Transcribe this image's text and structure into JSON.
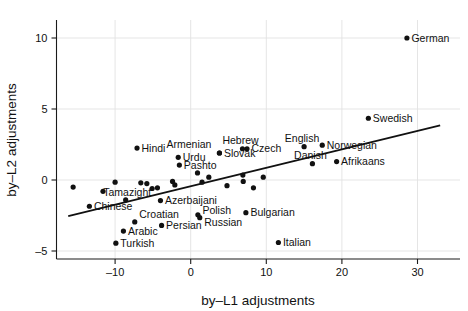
{
  "chart_data": {
    "type": "scatter",
    "title": "",
    "xlabel": "by–L1 adjustments",
    "ylabel": "by–L2 adjustments",
    "xlim": [
      -17.5,
      34.5
    ],
    "ylim": [
      -5.6,
      11.3
    ],
    "xticks": [
      -10,
      0,
      10,
      20,
      30
    ],
    "xticklabels": [
      "–10",
      "0",
      "10",
      "20",
      "30"
    ],
    "yticks": [
      -5,
      0,
      5,
      10
    ],
    "yticklabels": [
      "–5",
      "0",
      "5",
      "10"
    ],
    "grid": true,
    "legend": null,
    "marker": "filled-circle",
    "marker_color": "#111111",
    "fit_line": {
      "type": "linear-regression",
      "x_start": -16.2,
      "y_start": -2.55,
      "x_end": 33.0,
      "y_end": 3.85,
      "color": "#111111"
    },
    "points": [
      {
        "label": "German",
        "x": 28.6,
        "y": 10.0,
        "label_pos": "right"
      },
      {
        "label": "Swedish",
        "x": 23.5,
        "y": 4.35,
        "label_pos": "right"
      },
      {
        "label": "English",
        "x": 15.0,
        "y": 2.35,
        "label_pos": "above"
      },
      {
        "label": "Norwegian",
        "x": 17.4,
        "y": 2.45,
        "label_pos": "right"
      },
      {
        "label": "Danish",
        "x": 16.1,
        "y": 1.15,
        "label_pos": "above"
      },
      {
        "label": "Afrikaans",
        "x": 19.3,
        "y": 1.3,
        "label_pos": "right"
      },
      {
        "label": "Czech",
        "x": 7.45,
        "y": 2.2,
        "label_pos": "right"
      },
      {
        "label": "Hebrew",
        "x": 6.85,
        "y": 2.2,
        "label_pos": "above"
      },
      {
        "label": "Slovak",
        "x": 3.8,
        "y": 1.9,
        "label_pos": "right"
      },
      {
        "label": "Armenian",
        "x": 3.8,
        "y": 1.9,
        "label_pos": "far-left"
      },
      {
        "label": "Hindi",
        "x": -7.1,
        "y": 2.25,
        "label_pos": "right"
      },
      {
        "label": "Urdu",
        "x": -1.65,
        "y": 1.6,
        "label_pos": "right"
      },
      {
        "label": "Pashto",
        "x": -1.5,
        "y": 1.05,
        "label_pos": "right"
      },
      {
        "label": "Bulgarian",
        "x": 7.3,
        "y": -2.3,
        "label_pos": "right"
      },
      {
        "label": "Italian",
        "x": 11.6,
        "y": -4.4,
        "label_pos": "right"
      },
      {
        "label": "Polish",
        "x": 0.95,
        "y": -2.45,
        "label_pos": "right-upper"
      },
      {
        "label": "Russian",
        "x": 1.2,
        "y": -2.65,
        "label_pos": "right-lower"
      },
      {
        "label": "Persian",
        "x": -3.85,
        "y": -3.2,
        "label_pos": "right"
      },
      {
        "label": "Croatian",
        "x": -7.4,
        "y": -2.95,
        "label_pos": "above-right"
      },
      {
        "label": "Arabic",
        "x": -8.9,
        "y": -3.6,
        "label_pos": "right"
      },
      {
        "label": "Turkish",
        "x": -9.9,
        "y": -4.45,
        "label_pos": "right"
      },
      {
        "label": "Chinese",
        "x": -13.4,
        "y": -1.85,
        "label_pos": "right"
      },
      {
        "label": "Azerbaijani",
        "x": -4.0,
        "y": -1.45,
        "label_pos": "right"
      },
      {
        "label": "Tamazight",
        "x": -5.1,
        "y": -0.6,
        "label_pos": "below-left"
      },
      {
        "label": "",
        "x": -15.55,
        "y": -0.5,
        "label_pos": ""
      },
      {
        "label": "",
        "x": -11.6,
        "y": -0.8,
        "label_pos": ""
      },
      {
        "label": "",
        "x": -10.0,
        "y": -0.15,
        "label_pos": ""
      },
      {
        "label": "",
        "x": -8.6,
        "y": -1.4,
        "label_pos": ""
      },
      {
        "label": "",
        "x": -6.6,
        "y": -0.2,
        "label_pos": ""
      },
      {
        "label": "",
        "x": -5.8,
        "y": -0.25,
        "label_pos": ""
      },
      {
        "label": "",
        "x": -4.4,
        "y": -0.55,
        "label_pos": ""
      },
      {
        "label": "",
        "x": -2.4,
        "y": -0.1,
        "label_pos": ""
      },
      {
        "label": "",
        "x": -2.1,
        "y": -0.35,
        "label_pos": ""
      },
      {
        "label": "",
        "x": 0.9,
        "y": 0.5,
        "label_pos": ""
      },
      {
        "label": "",
        "x": 1.5,
        "y": -0.15,
        "label_pos": ""
      },
      {
        "label": "",
        "x": 2.4,
        "y": 0.2,
        "label_pos": ""
      },
      {
        "label": "",
        "x": 4.8,
        "y": -0.4,
        "label_pos": ""
      },
      {
        "label": "",
        "x": 6.9,
        "y": 0.35,
        "label_pos": ""
      },
      {
        "label": "",
        "x": 6.95,
        "y": -0.1,
        "label_pos": ""
      },
      {
        "label": "",
        "x": 8.3,
        "y": -0.55,
        "label_pos": ""
      },
      {
        "label": "",
        "x": 9.6,
        "y": 0.2,
        "label_pos": ""
      }
    ]
  },
  "axes": {
    "x_title": "by–L1 adjustments",
    "y_title": "by–L2 adjustments"
  }
}
